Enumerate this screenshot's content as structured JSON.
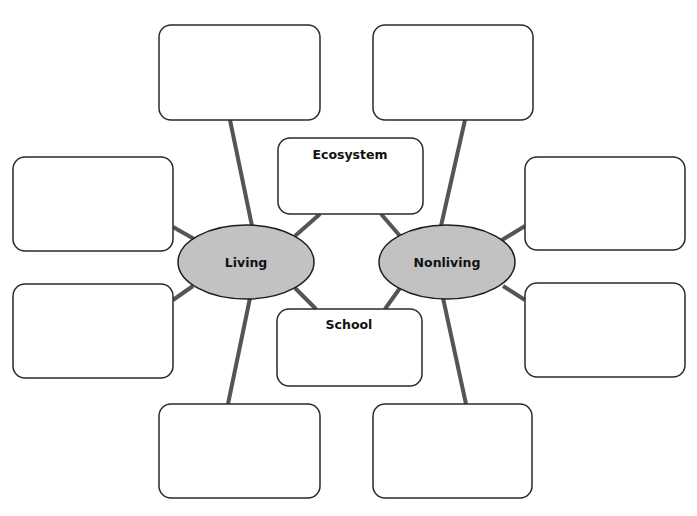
{
  "diagram": {
    "type": "double bubble map",
    "hubs": [
      {
        "id": "living",
        "label": "Living",
        "cx": 246,
        "cy": 262,
        "rx": 68,
        "ry": 37
      },
      {
        "id": "nonliving",
        "label": "Nonliving",
        "cx": 447,
        "cy": 262,
        "rx": 68,
        "ry": 37
      }
    ],
    "shared_boxes": [
      {
        "id": "ecosystem",
        "label": "Ecosystem",
        "x": 278,
        "y": 138,
        "w": 145,
        "h": 76
      },
      {
        "id": "school",
        "label": "School",
        "x": 277,
        "y": 309,
        "w": 145,
        "h": 77
      }
    ],
    "living_boxes": [
      {
        "id": "living-top",
        "label": "",
        "x": 159,
        "y": 25,
        "w": 161,
        "h": 95
      },
      {
        "id": "living-left-upper",
        "label": "",
        "x": 13,
        "y": 157,
        "w": 160,
        "h": 94
      },
      {
        "id": "living-left-lower",
        "label": "",
        "x": 13,
        "y": 284,
        "w": 160,
        "h": 94
      },
      {
        "id": "living-bottom",
        "label": "",
        "x": 159,
        "y": 404,
        "w": 161,
        "h": 94
      }
    ],
    "nonliving_boxes": [
      {
        "id": "nonliving-top",
        "label": "",
        "x": 373,
        "y": 25,
        "w": 160,
        "h": 95
      },
      {
        "id": "nonliving-right-upper",
        "label": "",
        "x": 525,
        "y": 157,
        "w": 160,
        "h": 93
      },
      {
        "id": "nonliving-right-lower",
        "label": "",
        "x": 525,
        "y": 283,
        "w": 160,
        "h": 94
      },
      {
        "id": "nonliving-bottom",
        "label": "",
        "x": 373,
        "y": 404,
        "w": 159,
        "h": 94
      }
    ],
    "colors": {
      "hub_fill": "#c2c2c2",
      "hub_stroke": "#1e1e1e",
      "box_fill": "#ffffff",
      "box_stroke": "#2a2a2a",
      "connector": "#555555",
      "text": "#111111"
    }
  }
}
